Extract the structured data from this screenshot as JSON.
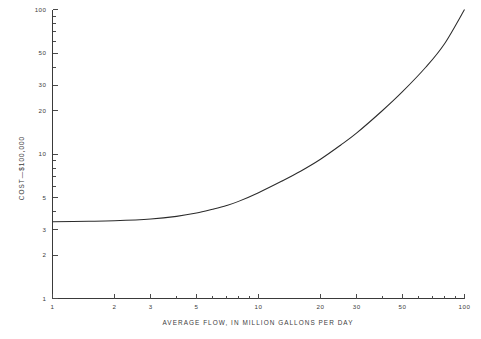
{
  "chart_data": {
    "type": "line",
    "title": "",
    "xlabel": "AVERAGE FLOW, IN MILLION GALLONS PER DAY",
    "ylabel": "COST—$100,000",
    "xscale": "log",
    "yscale": "log",
    "xlim": [
      1,
      100
    ],
    "ylim": [
      1,
      100
    ],
    "grid": false,
    "legend": null,
    "xticks": [
      1,
      2,
      3,
      5,
      10,
      20,
      30,
      50,
      100
    ],
    "xtick_labels": [
      "1",
      "2",
      "3",
      "5",
      "10",
      "20",
      "30",
      "50",
      "100"
    ],
    "yticks": [
      1,
      2,
      3,
      5,
      10,
      20,
      30,
      50,
      100
    ],
    "ytick_labels": [
      "1",
      "2",
      "3",
      "5",
      "10",
      "20",
      "30",
      "50",
      "100"
    ],
    "series": [
      {
        "name": "cost curve",
        "x": [
          1,
          1.5,
          2,
          3,
          4,
          5,
          6,
          7,
          8,
          10,
          13,
          16,
          20,
          25,
          30,
          40,
          50,
          65,
          80,
          100
        ],
        "y": [
          3.4,
          3.42,
          3.45,
          3.55,
          3.7,
          3.9,
          4.15,
          4.4,
          4.7,
          5.4,
          6.5,
          7.6,
          9.2,
          11.5,
          14.0,
          20.0,
          27.0,
          40.0,
          58.0,
          100.0
        ]
      }
    ]
  },
  "axis_titles": {
    "x": "AVERAGE FLOW, IN MILLION GALLONS PER DAY",
    "y_parts": {
      "prefix": "COST—",
      "value": "$100,000"
    }
  },
  "colors": {
    "curve": "#2b2b2b",
    "axis": "#3a3a3a",
    "text": "#3c3c3c",
    "background": "#ffffff"
  }
}
